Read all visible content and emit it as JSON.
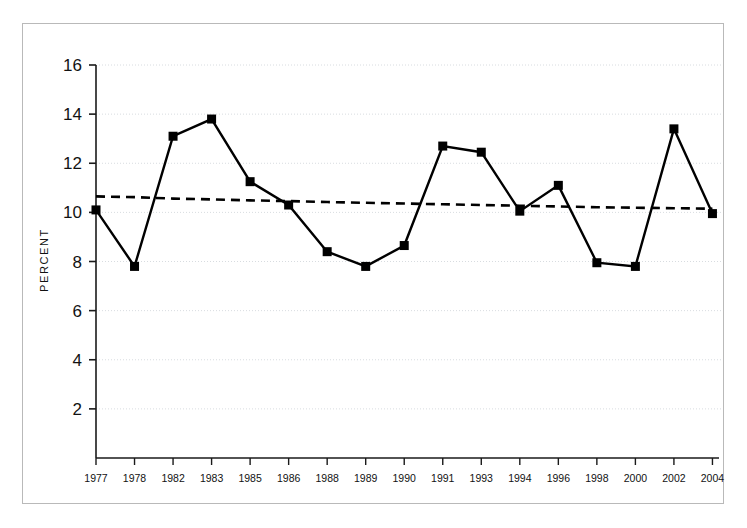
{
  "chart_data": {
    "type": "line",
    "title": "",
    "xlabel": "",
    "ylabel": "PERCENT",
    "ylim": [
      0,
      16
    ],
    "xlim_categories_count": 17,
    "grid": true,
    "grid_style": "dotted-light-gray",
    "legend": null,
    "categories": [
      "1977",
      "1978",
      "1982",
      "1983",
      "1985",
      "1986",
      "1988",
      "1989",
      "1990",
      "1991",
      "1993",
      "1994",
      "1996",
      "1998",
      "2000",
      "2002",
      "2004"
    ],
    "ytick_labels": [
      "2",
      "4",
      "6",
      "8",
      "10",
      "12",
      "14",
      "16"
    ],
    "ytick_values": [
      2,
      4,
      6,
      8,
      10,
      12,
      14,
      16
    ],
    "series": [
      {
        "name": "Percent",
        "style": "solid-line-with-square-markers",
        "color": "#000000",
        "marker": "square",
        "values": [
          10.1,
          7.8,
          13.1,
          13.8,
          11.25,
          10.3,
          8.4,
          7.8,
          8.65,
          12.7,
          12.45,
          10.05,
          11.1,
          7.95,
          7.8,
          13.4,
          9.95
        ]
      },
      {
        "name": "Trend",
        "style": "dashed-line",
        "color": "#000000",
        "marker": "none",
        "values": [
          10.65,
          10.62,
          10.56,
          10.53,
          10.49,
          10.46,
          10.42,
          10.39,
          10.36,
          10.33,
          10.3,
          10.27,
          10.24,
          10.21,
          10.19,
          10.17,
          10.15
        ]
      }
    ],
    "axis_color": "#1a1a1a",
    "background": "#ffffff"
  },
  "figure": {
    "frame_color": "#b9b9b9"
  }
}
